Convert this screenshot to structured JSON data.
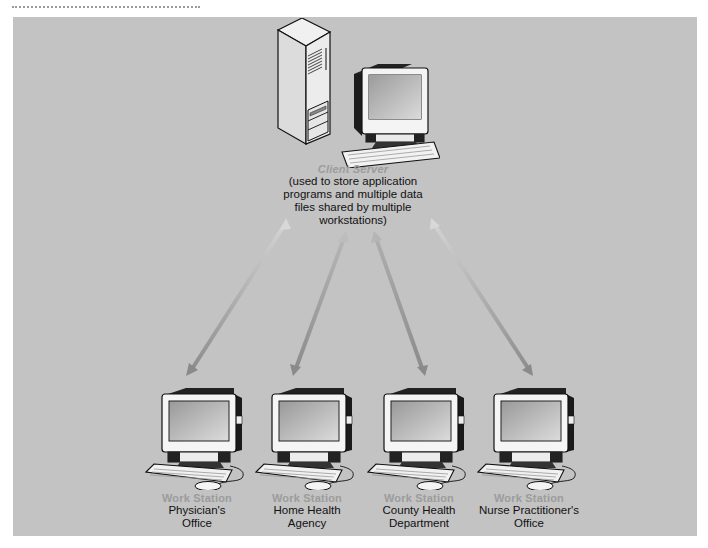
{
  "diagram": {
    "colors": {
      "panel_background": "#c3c3c3",
      "arrow": "#8f8f8f",
      "role_label": "#9c9c9c",
      "description_text": "#111111"
    },
    "server": {
      "icon": "server-tower-with-monitor-icon",
      "role": "Client Server",
      "description_lines": [
        "(used to store application",
        "programs and multiple data",
        "files shared by multiple",
        "workstations)"
      ]
    },
    "workstations": [
      {
        "icon": "workstation-computer-icon",
        "role": "Work Station",
        "lines": [
          "Physician's",
          "Office"
        ]
      },
      {
        "icon": "workstation-computer-icon",
        "role": "Work Station",
        "lines": [
          "Home Health",
          "Agency"
        ]
      },
      {
        "icon": "workstation-computer-icon",
        "role": "Work Station",
        "lines": [
          "County Health",
          "Department"
        ]
      },
      {
        "icon": "workstation-computer-icon",
        "role": "Work Station",
        "lines": [
          "Nurse Practitioner's",
          "Office"
        ]
      }
    ],
    "connections": [
      {
        "from": "Client Server",
        "to": "Physician's Office",
        "type": "bidirectional-arrow"
      },
      {
        "from": "Client Server",
        "to": "Home Health Agency",
        "type": "bidirectional-arrow"
      },
      {
        "from": "Client Server",
        "to": "County Health Department",
        "type": "bidirectional-arrow"
      },
      {
        "from": "Client Server",
        "to": "Nurse Practitioner's Office",
        "type": "bidirectional-arrow"
      }
    ]
  }
}
